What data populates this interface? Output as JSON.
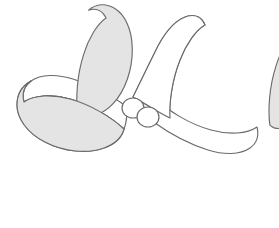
{
  "figure": {
    "title": "Four-bladed propeller line drawing",
    "subject_name": "propeller",
    "blade_count": "4",
    "background_color": "#ffffff",
    "stroke_color": "#6b6b6b",
    "blade_fill_color": "#e4e4e4",
    "blade_highlight_color": "#ffffff",
    "hub_fill_color": "#ffffff",
    "canvas_width": "279",
    "canvas_height": "228",
    "hub": {
      "name": "propeller-hub",
      "ellipse_left": {
        "cx": "133",
        "cy": "108",
        "rx": "11",
        "ry": "10"
      },
      "ellipse_right": {
        "cx": "148",
        "cy": "117",
        "rx": "11",
        "ry": "10"
      }
    },
    "blades": [
      {
        "name": "blade-top",
        "position": "top",
        "tip_x": "112",
        "tip_y": "14",
        "fill": "#e4e4e4",
        "face_fill": "#ffffff"
      },
      {
        "name": "blade-right",
        "position": "right",
        "tip_x": "268",
        "tip_y": "98",
        "fill": "#e4e4e4",
        "face_fill": "#ffffff"
      },
      {
        "name": "blade-bottom",
        "position": "bottom",
        "tip_x": "186",
        "tip_y": "206",
        "fill": "#e4e4e4",
        "face_fill": "#ffffff"
      },
      {
        "name": "blade-left",
        "position": "left",
        "tip_x": "22",
        "tip_y": "122",
        "fill": "#e4e4e4",
        "face_fill": "#ffffff"
      }
    ]
  }
}
